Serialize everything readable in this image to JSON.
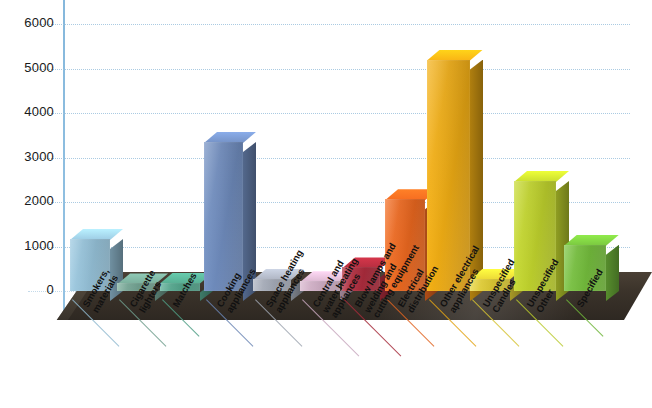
{
  "chart_data": {
    "type": "bar",
    "title": "",
    "subtitle": "",
    "xlabel": "",
    "ylabel": "",
    "ylim": [
      0,
      6000
    ],
    "ytick_values": [
      0,
      1000,
      2000,
      3000,
      4000,
      5000,
      6000
    ],
    "ytick_labels": [
      "0",
      "1000",
      "2000",
      "3000",
      "4000",
      "5000",
      "6000"
    ],
    "grid": true,
    "legend": "none",
    "style": "3d-bar",
    "categories": [
      "Smokers' materials",
      "Cigarette lighters",
      "Matches",
      "Cooking appliances",
      "Space heating appliances",
      "Central and water heating appliances",
      "Blow lamps, welding and cutting equipment",
      "Electrical distribution",
      "Other electrical appliances",
      "Unspecified Candles",
      "Unspecified Other",
      "Specified"
    ],
    "category_lines": [
      [
        "Smokers,",
        "materials"
      ],
      [
        "Cigarette",
        "lighters"
      ],
      [
        "Matches"
      ],
      [
        "Cooking",
        "appliances"
      ],
      [
        "Space heating",
        "appliances"
      ],
      [
        "Central and",
        "water heating",
        "appliances"
      ],
      [
        "Blow lamps and",
        "welding and",
        "cutting equipment"
      ],
      [
        "Electrical",
        "distribution"
      ],
      [
        "Other electrical",
        "appliances"
      ],
      [
        "Unspecified",
        "Candles"
      ],
      [
        "Unspecified",
        "Other"
      ],
      [
        "Specified"
      ]
    ],
    "values": [
      1170,
      170,
      190,
      3350,
      270,
      220,
      530,
      2060,
      5200,
      280,
      2470,
      1040
    ],
    "colors": [
      "#8fb9cf",
      "#6f9d8d",
      "#4f9d85",
      "#6a85b4",
      "#9ea4b0",
      "#c7a7bd",
      "#a52a3a",
      "#e0631e",
      "#e2a313",
      "#d6c332",
      "#b7c92b",
      "#6fb53a"
    ],
    "grid_color": "#9dc2dd",
    "axis_color": "#7fb4da",
    "floor_color": "#3b332a",
    "background_color": "#ffffff"
  }
}
